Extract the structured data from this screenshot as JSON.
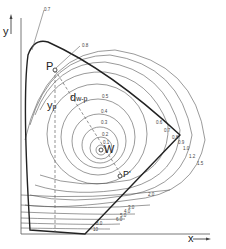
{
  "diagram": {
    "axes": {
      "x_label": "x",
      "y_label": "y"
    },
    "points": {
      "P": "P",
      "P_prime": "P'",
      "W": "W"
    },
    "annotations": {
      "y_p": {
        "main": "y",
        "sub": "p"
      },
      "d_wp": {
        "main": "d",
        "sub": "w-p"
      }
    },
    "contour_labels": {
      "inner": [
        "0.1",
        "0.2",
        "0.3",
        "0.4",
        "0.5",
        "0.6",
        "0.7"
      ],
      "outer_right": [
        "0.6",
        "0.7",
        "0.8",
        "0.9",
        "1.0",
        "1.2",
        "1.5",
        "2.0"
      ],
      "lower": [
        "3.0",
        "4.0",
        "5.0",
        "6.0",
        "8.0",
        "10"
      ]
    },
    "colors": {
      "stroke": "#333333",
      "contour": "#555555",
      "dashed": "#666666"
    }
  }
}
